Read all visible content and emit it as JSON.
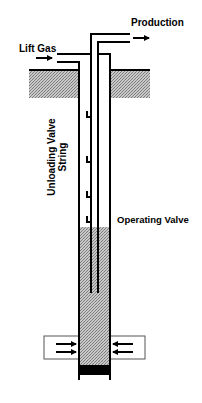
{
  "diagram": {
    "type": "gas-lift-well-schematic",
    "labels": {
      "production": "Production",
      "lift_gas": "Lift Gas",
      "unloading_valve_line1": "Unloading Valve",
      "unloading_valve_line2": "String",
      "operating_valve": "Operating Valve"
    },
    "colors": {
      "line": "#000000",
      "fill_ground": "#b0b0b0",
      "fill_fluid": "#a8a8a8",
      "plug": "#000000",
      "perforation_box_border": "#555555",
      "background": "#ffffff"
    },
    "components": [
      {
        "name": "ground-surface",
        "shading": "stippled"
      },
      {
        "name": "casing",
        "count": 2
      },
      {
        "name": "production-tubing"
      },
      {
        "name": "unloading-valves",
        "count": 4
      },
      {
        "name": "operating-valve"
      },
      {
        "name": "well-fluid",
        "shading": "stippled"
      },
      {
        "name": "perforations",
        "inflow_arrows": 4
      },
      {
        "name": "bottom-plug"
      }
    ]
  }
}
